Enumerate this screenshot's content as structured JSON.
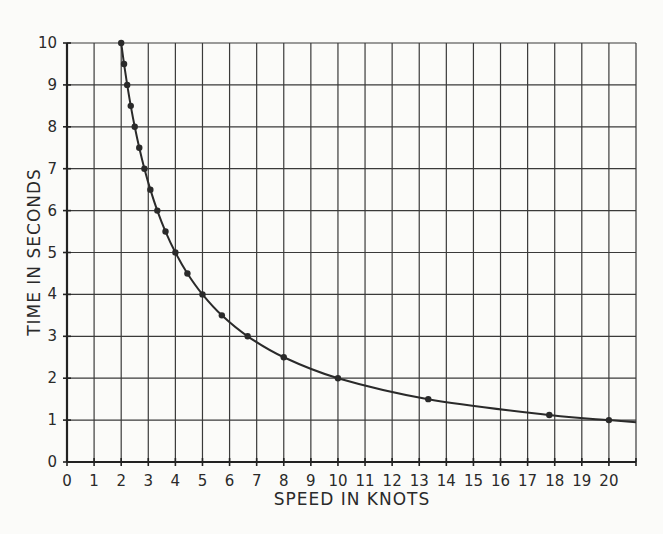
{
  "chart_data": {
    "type": "line",
    "title": "",
    "xlabel": "SPEED IN KNOTS",
    "ylabel": "TIME IN SECONDS",
    "xlim": [
      0,
      21
    ],
    "ylim": [
      0,
      10
    ],
    "grid": true,
    "legend": null,
    "x_ticks": [
      "0",
      "1",
      "2",
      "3",
      "4",
      "5",
      "6",
      "7",
      "8",
      "9",
      "10",
      "11",
      "12",
      "13",
      "14",
      "15",
      "16",
      "17",
      "18",
      "19",
      "20"
    ],
    "y_ticks": [
      "0",
      "1",
      "2",
      "3",
      "4",
      "5",
      "6",
      "7",
      "8",
      "9",
      "10"
    ],
    "series": [
      {
        "name": "time vs speed",
        "x": [
          2.0,
          2.105,
          2.222,
          2.353,
          2.5,
          2.667,
          2.857,
          3.077,
          3.333,
          3.636,
          4.0,
          4.444,
          5.0,
          5.714,
          6.667,
          8.0,
          10.0,
          13.333,
          17.8,
          20.0
        ],
        "y": [
          10,
          9.5,
          9,
          8.5,
          8,
          7.5,
          7,
          6.5,
          6,
          5.5,
          5,
          4.5,
          4,
          3.5,
          3,
          2.5,
          2,
          1.5,
          1.12,
          1.0
        ]
      }
    ],
    "curve_end": {
      "x": 21,
      "y": 0.95
    }
  }
}
